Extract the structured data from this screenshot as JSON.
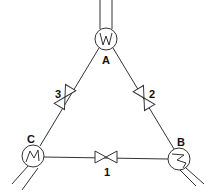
{
  "diagram": {
    "type": "pipe-network-triangle",
    "nodes": [
      {
        "id": "A",
        "label": "A",
        "symbol": "W",
        "x": 106,
        "y": 39
      },
      {
        "id": "B",
        "label": "B",
        "symbol": "heat-exchanger",
        "x": 179,
        "y": 159
      },
      {
        "id": "C",
        "label": "C",
        "symbol": "heat-exchanger",
        "x": 33,
        "y": 156
      }
    ],
    "valves": [
      {
        "id": "1",
        "label": "1",
        "between": [
          "C",
          "B"
        ]
      },
      {
        "id": "2",
        "label": "2",
        "between": [
          "A",
          "B"
        ]
      },
      {
        "id": "3",
        "label": "3",
        "between": [
          "A",
          "C"
        ]
      }
    ],
    "colors": {
      "line": "#333333",
      "text": "#111111",
      "background": "#ffffff"
    }
  }
}
